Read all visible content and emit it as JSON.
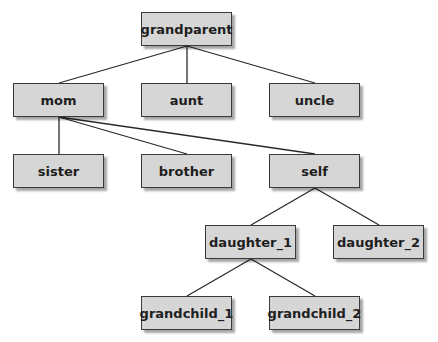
{
  "diagram": {
    "type": "family-tree",
    "nodes": [
      {
        "id": "grandparent",
        "label": "grandparent",
        "x": 141,
        "y": 12
      },
      {
        "id": "mom",
        "label": "mom",
        "x": 13,
        "y": 83
      },
      {
        "id": "aunt",
        "label": "aunt",
        "x": 141,
        "y": 83
      },
      {
        "id": "uncle",
        "label": "uncle",
        "x": 269,
        "y": 83
      },
      {
        "id": "sister",
        "label": "sister",
        "x": 13,
        "y": 154
      },
      {
        "id": "brother",
        "label": "brother",
        "x": 141,
        "y": 154
      },
      {
        "id": "self",
        "label": "self",
        "x": 269,
        "y": 154
      },
      {
        "id": "daughter_1",
        "label": "daughter_1",
        "x": 205,
        "y": 225
      },
      {
        "id": "daughter_2",
        "label": "daughter_2",
        "x": 333,
        "y": 225
      },
      {
        "id": "grandchild_1",
        "label": "grandchild_1",
        "x": 141,
        "y": 296
      },
      {
        "id": "grandchild_2",
        "label": "grandchild_2",
        "x": 269,
        "y": 296
      }
    ],
    "edges": [
      {
        "from": "grandparent",
        "to": "mom"
      },
      {
        "from": "grandparent",
        "to": "aunt"
      },
      {
        "from": "grandparent",
        "to": "uncle"
      },
      {
        "from": "mom",
        "to": "sister"
      },
      {
        "from": "mom",
        "to": "brother"
      },
      {
        "from": "mom",
        "to": "self"
      },
      {
        "from": "self",
        "to": "daughter_1"
      },
      {
        "from": "self",
        "to": "daughter_2"
      },
      {
        "from": "daughter_1",
        "to": "grandchild_1"
      },
      {
        "from": "daughter_1",
        "to": "grandchild_2"
      }
    ],
    "colors": {
      "node_fill": "#d6d6d6",
      "node_border": "#3a3a3a",
      "edge": "#2a2a2a"
    }
  }
}
